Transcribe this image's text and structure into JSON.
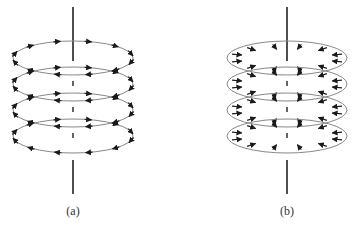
{
  "figure": {
    "panels": [
      {
        "id": "a",
        "label": "(a)",
        "description": "Axial wire with circulating (azimuthal) field loops",
        "arrow_direction": "circulating",
        "center_x": 73,
        "loop_count": 4
      },
      {
        "id": "b",
        "label": "(b)",
        "description": "Axial wire with radially inward-pointing arrows on loops",
        "arrow_direction": "radial-inward",
        "center_x": 287,
        "loop_count": 4
      }
    ],
    "colors": {
      "loop": "#888888",
      "axis": "#222222",
      "arrow": "#1a1a1a",
      "label": "#333333"
    }
  }
}
